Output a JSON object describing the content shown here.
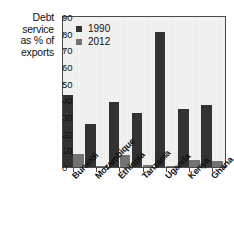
{
  "chart_data": {
    "type": "bar",
    "title": "",
    "xlabel": "",
    "ylabel": "Debt service as % of exports",
    "ylabel_lines": [
      "Debt",
      "service",
      "as % of",
      "exports"
    ],
    "categories": [
      "Burundi",
      "Mozambique",
      "Ethiopia",
      "Tanzania",
      "Uganda",
      "Kenya",
      "Ghana"
    ],
    "series": [
      {
        "name": "1990",
        "color": "#323232",
        "values": [
          43.5,
          26,
          39,
          32.5,
          81,
          35,
          37.5
        ]
      },
      {
        "name": "2012",
        "color": "#737373",
        "values": [
          8,
          0.6,
          7,
          1.3,
          0.9,
          4.3,
          3.8
        ]
      }
    ],
    "ylim": [
      0,
      90
    ],
    "yticks": [
      0,
      10,
      20,
      30,
      40,
      50,
      60,
      70,
      80,
      90
    ],
    "ytick_labels": [
      "0",
      "10",
      "20",
      "30",
      "40",
      "50",
      "60",
      "70",
      "80",
      "90"
    ],
    "grid": false,
    "legend_position": "top-left-inside"
  },
  "legend": {
    "entries": [
      {
        "label": "1990",
        "color": "#323232"
      },
      {
        "label": "2012",
        "color": "#737373"
      }
    ]
  },
  "colors": {
    "series_1990": "#323232",
    "series_2012": "#737373",
    "plot_background": "#f2f2f0",
    "axis": "#4a4a4a",
    "text": "#111111",
    "page_background": "#ffffff"
  }
}
